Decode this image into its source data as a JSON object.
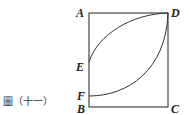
{
  "figure": {
    "caption": "圖（十一）",
    "labels": {
      "A": "A",
      "B": "B",
      "C": "C",
      "D": "D",
      "E": "E",
      "F": "F"
    },
    "stroke_color": "#333333",
    "background": "#ffffff",
    "shapes": {
      "square": {
        "vertices": [
          "A",
          "B",
          "C",
          "D"
        ]
      },
      "arcs": [
        {
          "from": "E",
          "to": "D",
          "description": "arc from E bulging toward upper-left to D"
        },
        {
          "from": "F",
          "to": "D",
          "description": "arc from F bulging toward lower-right to D"
        }
      ]
    }
  }
}
